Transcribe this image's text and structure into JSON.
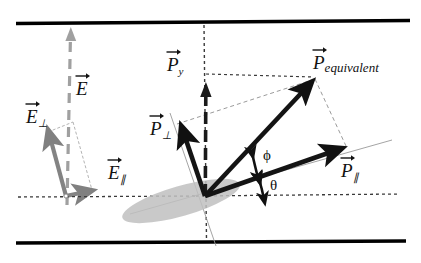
{
  "figure": {
    "background_color": "#ffffff",
    "width": 421,
    "height": 263
  },
  "colors": {
    "boundary_bar": "#000000",
    "vector_dark": "#111111",
    "vector_gray": "#808080",
    "dash_light": "#a8a8a8",
    "dotted_dark": "#333333",
    "ellipse_fill": "#bdbdbd",
    "thin_axis": "#9a9a9a"
  },
  "labels": {
    "E_field": {
      "symbol": "E",
      "subscript": "",
      "text": "E"
    },
    "E_perp": {
      "symbol": "E",
      "subscript": "⊥",
      "text": "E⊥"
    },
    "E_parallel": {
      "symbol": "E",
      "subscript": "∥",
      "text": "E∥"
    },
    "P_y": {
      "symbol": "P",
      "subscript": "y",
      "text": "Py"
    },
    "P_perp": {
      "symbol": "P",
      "subscript": "⊥",
      "text": "P⊥"
    },
    "P_parallel": {
      "symbol": "P",
      "subscript": "∥",
      "text": "P∥"
    },
    "P_equivalent": {
      "symbol": "P",
      "subscript": "equivalent",
      "text": "Pequivalent"
    }
  },
  "angles": {
    "phi": {
      "glyph": "ϕ",
      "name": "phi",
      "between": "P_equivalent and P_parallel"
    },
    "theta": {
      "glyph": "θ",
      "name": "theta",
      "between": "P_parallel and horizontal axis"
    }
  },
  "geometry": {
    "origin": {
      "x": 205,
      "y": 196
    },
    "left_origin": {
      "x": 66,
      "y": 196
    },
    "top_bar": {
      "x1": 16,
      "y1": 23,
      "x2": 410,
      "y2": 20
    },
    "bottom_bar": {
      "x1": 16,
      "y1": 243,
      "x2": 406,
      "y2": 241
    },
    "E_axis": {
      "x1": 66,
      "y1": 200,
      "x2": 70,
      "y2": 30
    },
    "E_perp_tip": {
      "x": 48,
      "y": 131
    },
    "E_parallel_tip": {
      "x": 92,
      "y": 191
    },
    "P_y_tip": {
      "x": 206,
      "y": 84
    },
    "P_perp_tip": {
      "x": 181,
      "y": 128
    },
    "P_parallel_tip": {
      "x": 340,
      "y": 148
    },
    "P_equivalent_tip": {
      "x": 312,
      "y": 82
    },
    "ellipse": {
      "cx": 181,
      "cy": 200,
      "rx": 60,
      "ry": 15,
      "rotation_deg": -16
    }
  }
}
